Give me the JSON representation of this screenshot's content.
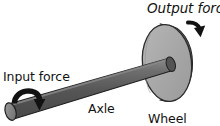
{
  "diagram": {
    "labels": {
      "output_force": "Output force",
      "input_force": "Input force",
      "axle": "Axle",
      "wheel": "Wheel"
    },
    "parts": {
      "wheel_name": "wheel-disc",
      "axle_name": "axle-rod",
      "input_arrow_name": "input-force-curved-arrow",
      "output_arrow_name": "output-force-curved-arrow"
    },
    "colors": {
      "background": "#ffffff",
      "wheel_face": "#a8a8a8",
      "wheel_rim": "#5f5f5f",
      "wheel_outline": "#2b2b2b",
      "axle_body": "#5a5a5a",
      "axle_highlight": "#7e7e7e",
      "axle_cap": "#8a8a8a",
      "axle_outline": "#1f1f1f",
      "arrow": "#121212",
      "text": "#111111"
    }
  }
}
